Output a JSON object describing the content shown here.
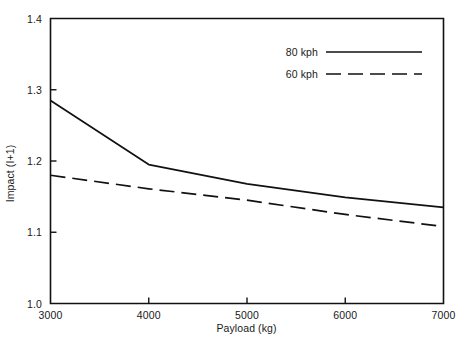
{
  "chart_data": {
    "type": "line",
    "title": "",
    "xlabel": "Payload (kg)",
    "ylabel": "Impact (I+1)",
    "xlim": [
      3000,
      7000
    ],
    "ylim": [
      1.0,
      1.4
    ],
    "xticks": [
      "3000",
      "4000",
      "5000",
      "6000",
      "7000"
    ],
    "xtick_values": [
      3000,
      4000,
      5000,
      6000,
      7000
    ],
    "yticks": [
      "1.0",
      "1.1",
      "1.2",
      "1.3",
      "1.4"
    ],
    "ytick_values": [
      1.0,
      1.1,
      1.2,
      1.3,
      1.4
    ],
    "grid": false,
    "legend_position": "top-right-inside",
    "x": [
      3000,
      4000,
      5000,
      6000,
      7000
    ],
    "series": [
      {
        "name": "80 kph",
        "style": "solid",
        "color": "#111111",
        "values": [
          1.285,
          1.195,
          1.168,
          1.149,
          1.135
        ]
      },
      {
        "name": "60 kph",
        "style": "dashed",
        "color": "#111111",
        "values": [
          1.18,
          1.161,
          1.145,
          1.125,
          1.108
        ]
      }
    ]
  },
  "legend": {
    "entries": [
      {
        "label": "80 kph",
        "style": "solid"
      },
      {
        "label": "60 kph",
        "style": "dashed"
      }
    ]
  }
}
